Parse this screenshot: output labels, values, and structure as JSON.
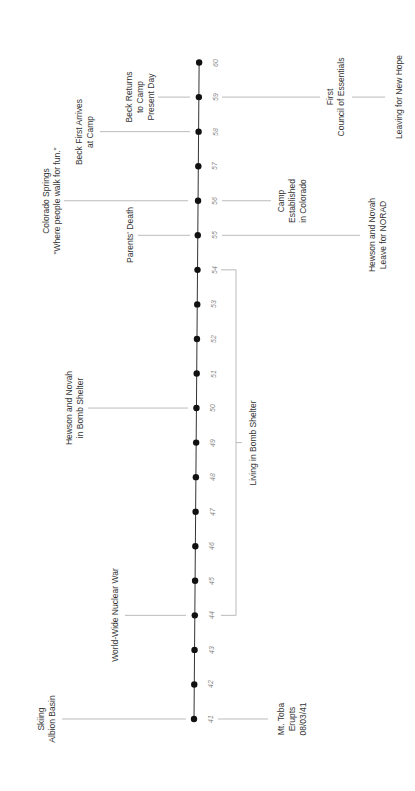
{
  "timeline": {
    "orientation": "rotated-90-ccw",
    "colors": {
      "axis": "#333333",
      "dot": "#111111",
      "connector": "#aaaaaa",
      "text": "#333333",
      "tick_text": "#888888"
    },
    "years": [
      "41",
      "42",
      "43",
      "44",
      "45",
      "46",
      "47",
      "48",
      "49",
      "50",
      "51",
      "52",
      "53",
      "54",
      "55",
      "56",
      "57",
      "58",
      "59",
      "60"
    ],
    "events_left": [
      {
        "id": "skiing",
        "year": "41",
        "text": "Skiing\nAlbion Basin"
      },
      {
        "id": "nuclear-war",
        "year": "44",
        "text": "World-Wide Nuclear War"
      },
      {
        "id": "bomb-shelter",
        "year": "50",
        "text": "Hewson and Novah\nin Bomb Shelter"
      },
      {
        "id": "parents-death",
        "year": "55",
        "text": "Parents' Death"
      },
      {
        "id": "colorado-springs",
        "year": "56",
        "text": "Colorado Springs\n\"Where people walk for fun.\""
      },
      {
        "id": "beck-arrives",
        "year": "58",
        "text": "Beck First Arrives\nat Camp"
      },
      {
        "id": "beck-returns",
        "year": "59",
        "text": "Beck Returns\nto Camp\nPresent Day"
      }
    ],
    "events_right": [
      {
        "id": "mt-toba",
        "year": "41",
        "text": "Mt. Toba\nErupts\n08/03/41"
      },
      {
        "id": "camp-established",
        "year": "56",
        "text": "Camp\nEstablished\nin Colorado"
      },
      {
        "id": "leave-norad",
        "year": "55",
        "text": "Hewson and Novah\nLeave for NORAD"
      },
      {
        "id": "first-council",
        "year": "59",
        "text": "First\nCouncil of Essentials"
      },
      {
        "id": "new-hope",
        "year": "59",
        "text": "Leaving for New Hope"
      }
    ],
    "span": {
      "id": "living-bomb-shelter",
      "from": "44",
      "to": "54",
      "text": "Living in Bomb Shelter"
    }
  }
}
